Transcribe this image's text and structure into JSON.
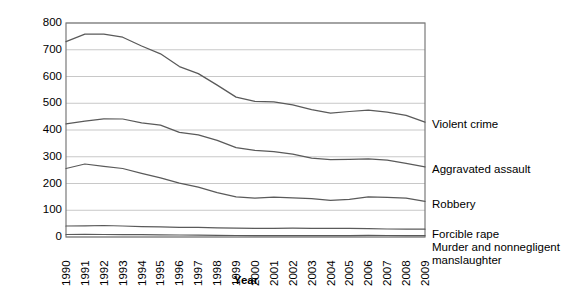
{
  "chart_data": {
    "type": "line",
    "title": "",
    "xlabel": "Year",
    "ylabel": "Crime rate (per 100,000 population)",
    "x": [
      1990,
      1991,
      1992,
      1993,
      1994,
      1995,
      1996,
      1997,
      1998,
      1999,
      2000,
      2001,
      2002,
      2003,
      2004,
      2005,
      2006,
      2007,
      2008,
      2009
    ],
    "xtick_labels": [
      "1990",
      "1991",
      "1992",
      "1993",
      "1994",
      "1995",
      "1996",
      "1997",
      "1998",
      "1999",
      "2000",
      "2001",
      "2002",
      "2003",
      "2004",
      "2005",
      "2006",
      "2007",
      "2008",
      "2009"
    ],
    "ytick_labels": [
      "800",
      "700",
      "600",
      "500",
      "400",
      "300",
      "200",
      "100",
      "0"
    ],
    "ylim": [
      0,
      800
    ],
    "ytick_values": [
      0,
      100,
      200,
      300,
      400,
      500,
      600,
      700,
      800
    ],
    "grid": "horizontal",
    "legend_position": "right-of-axes-inline",
    "line_color": "#5a5a5a",
    "grid_color": "#c8c8c8",
    "axis_color": "#7a7a7a",
    "series": [
      {
        "name": "Violent crime",
        "label_y_px": 125,
        "values": [
          730,
          758,
          758,
          747,
          714,
          685,
          637,
          611,
          568,
          523,
          507,
          505,
          494,
          476,
          463,
          469,
          474,
          467,
          455,
          429
        ]
      },
      {
        "name": "Aggravated assault",
        "label_y_px": 170,
        "values": [
          423,
          433,
          442,
          441,
          427,
          418,
          391,
          382,
          361,
          334,
          324,
          319,
          310,
          295,
          289,
          290,
          292,
          287,
          275,
          262
        ]
      },
      {
        "name": "Robbery",
        "label_y_px": 205,
        "values": [
          256,
          273,
          264,
          256,
          238,
          221,
          201,
          186,
          166,
          150,
          145,
          149,
          146,
          143,
          137,
          141,
          150,
          148,
          145,
          133
        ]
      },
      {
        "name": "Forcible rape",
        "label_y_px": 235,
        "values": [
          41,
          42,
          43,
          41,
          39,
          38,
          36,
          36,
          34,
          33,
          32,
          32,
          33,
          32,
          32,
          32,
          31,
          30,
          30,
          29
        ]
      },
      {
        "name": "Murder and nonnegligent\nmanslaughter",
        "label_y_px": 248,
        "values": [
          9.4,
          9.8,
          9.3,
          9.5,
          9,
          8.2,
          7.4,
          6.8,
          6.3,
          5.7,
          5.5,
          5.6,
          5.6,
          5.7,
          5.5,
          5.6,
          5.8,
          5.7,
          5.4,
          5
        ]
      }
    ]
  }
}
